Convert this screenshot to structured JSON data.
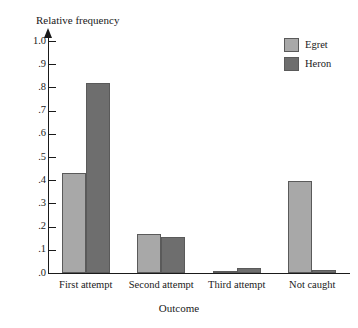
{
  "chart_data": {
    "type": "bar",
    "title": "",
    "xlabel": "Outcome",
    "ylabel": "Relative frequency",
    "ylim": [
      0.0,
      1.0
    ],
    "grid": false,
    "legend_position": "top-right",
    "categories": [
      "First attempt",
      "Second attempt",
      "Third attempt",
      "Not caught"
    ],
    "ytick_labels": [
      "1.0",
      ".9",
      ".8",
      ".7",
      ".6",
      ".5",
      ".4",
      ".3",
      ".2",
      ".1",
      ".0"
    ],
    "ytick_values": [
      1.0,
      0.9,
      0.8,
      0.7,
      0.6,
      0.5,
      0.4,
      0.3,
      0.2,
      0.1,
      0.0
    ],
    "series": [
      {
        "name": "Egret",
        "color": "#a8a8a8",
        "values": [
          0.43,
          0.17,
          0.01,
          0.395
        ]
      },
      {
        "name": "Heron",
        "color": "#6e6e6e",
        "values": [
          0.82,
          0.155,
          0.02,
          0.012
        ]
      }
    ]
  },
  "legend": {
    "items": [
      {
        "label": "Egret",
        "color": "#a8a8a8"
      },
      {
        "label": "Heron",
        "color": "#6e6e6e"
      }
    ]
  }
}
